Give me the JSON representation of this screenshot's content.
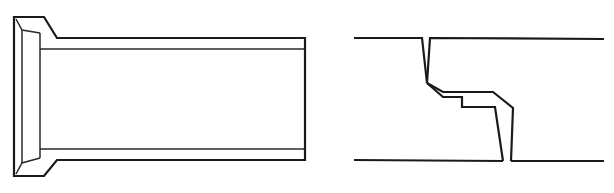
{
  "figure": {
    "colors": {
      "background": "#ffffff",
      "line": "#1a1a1a"
    },
    "panels": [
      {
        "id": "socket-pipe",
        "label": "",
        "shapes": {
          "outline": "14,17 44,17 57,38 305,38 305,160 57,160 44,176 14,176",
          "socket_inner_left": "22,30 22,163",
          "socket_inner_top": "16,19 22,30 40,33",
          "socket_inner_bottom": "16,174 22,163 40,158",
          "socket_inner_right": "40,33 40,158",
          "bore_top": "40,49 305,49",
          "bore_bottom": "40,149 305,149"
        }
      },
      {
        "id": "joint-section",
        "label": "",
        "shapes": {
          "top_left": "354,38 422,38 427,83",
          "top_right": "427,83 430,38 604,39",
          "upper_path": "427,83 443,92 493,92 513,108 511,161",
          "lower_path": "427,83 443,97 462,97 462,107 495,107 503,161",
          "bottom_left": "354,160 503,161",
          "bottom_right": "511,161 604,161"
        }
      }
    ]
  }
}
